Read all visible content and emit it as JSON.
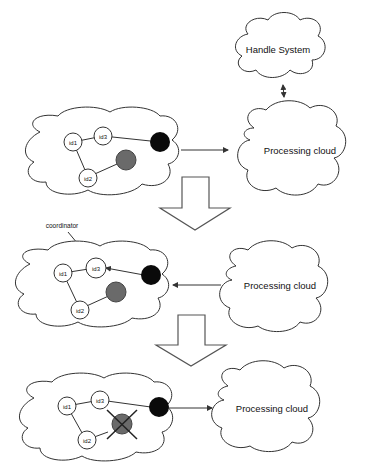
{
  "diagram": {
    "panels": [
      {
        "id": "panel-1",
        "nodes": [
          "id1",
          "id3",
          "id2"
        ],
        "processing_cloud_label": "Processing cloud",
        "arrow_direction": "left-to-right"
      },
      {
        "id": "panel-2",
        "nodes": [
          "id1",
          "id3",
          "id2"
        ],
        "annotation": "coordinator",
        "processing_cloud_label": "Processing cloud",
        "arrow_direction": "right-to-left"
      },
      {
        "id": "panel-3",
        "nodes": [
          "id1",
          "id3",
          "id2"
        ],
        "processing_cloud_label": "Processing cloud",
        "arrow_direction": "left-to-right",
        "failed_node": "grey-node-crossed"
      }
    ],
    "handle_system_label": "Handle System",
    "colors": {
      "black_node": "#0a0a0a",
      "grey_node": "#6a6a6a",
      "stroke": "#333333",
      "background": "#ffffff"
    }
  }
}
